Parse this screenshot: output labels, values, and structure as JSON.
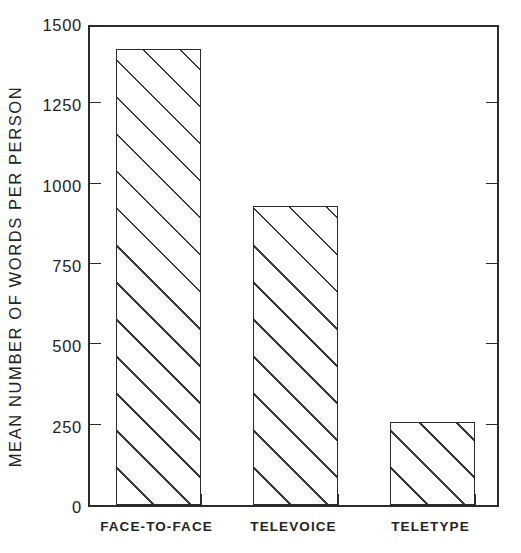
{
  "chart_data": {
    "type": "bar",
    "title": "",
    "subtitle": "",
    "xlabel": "",
    "ylabel": "MEAN NUMBER OF WORDS PER PERSON",
    "categories": [
      "FACE-TO-FACE",
      "TELEVOICE",
      "TELETYPE"
    ],
    "values": [
      1420,
      930,
      258
    ],
    "ylim": [
      0,
      1500
    ],
    "yticks": [
      0,
      250,
      500,
      750,
      1000,
      1250,
      1500
    ],
    "ytick_labels": [
      "0",
      "250",
      "500",
      "750",
      "1000",
      "1250",
      "1500"
    ],
    "grid": false,
    "legend": null,
    "legend_position": "none",
    "series": [
      {
        "name": "Mean number of words per person",
        "values": [
          1420,
          930,
          258
        ]
      }
    ],
    "bar_fill": "diagonal-hatch",
    "bar_edge_color": "#2b2b2b",
    "bar_fill_color": "#ffffff",
    "hatch_color": "#3a3a3a",
    "background_color": "#ffffff",
    "annotations": []
  }
}
